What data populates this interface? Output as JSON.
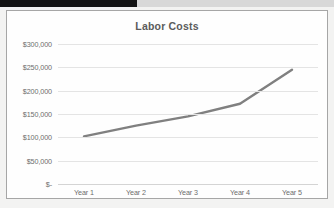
{
  "artifacts": {
    "top_black_bar": true,
    "black_bar_color": "#131313"
  },
  "chart_panel": {
    "background_color": "#fefefe",
    "border_color": "#a6a6a6"
  },
  "chart_data": {
    "type": "line",
    "title": "Labor Costs",
    "xlabel": "",
    "ylabel": "",
    "categories": [
      "Year 1",
      "Year 2",
      "Year 3",
      "Year 4",
      "Year 5"
    ],
    "series": [
      {
        "name": "Labor Costs",
        "color": "#808080",
        "values": [
          102000,
          125000,
          145000,
          172000,
          245000
        ]
      }
    ],
    "ylim": [
      0,
      300000
    ],
    "ytick_step": 50000,
    "ytick_labels": [
      "$300,000",
      "$250,000",
      "$200,000",
      "$150,000",
      "$100,000",
      "$50,000",
      "$-"
    ],
    "ytick_values": [
      300000,
      250000,
      200000,
      150000,
      100000,
      50000,
      0
    ],
    "grid": true,
    "grid_color": "#e4e4e4",
    "legend": false,
    "legend_position": "none",
    "markers": false,
    "line_width_px": 2.4,
    "title_color": "#5b5b5b",
    "tick_label_color": "#6d6d6d"
  }
}
